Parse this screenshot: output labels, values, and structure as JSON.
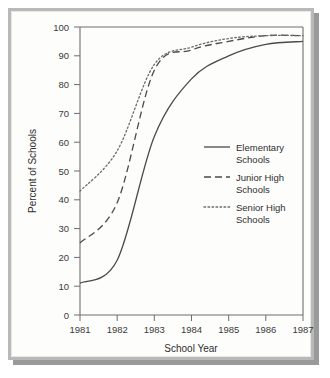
{
  "figure": {
    "frame_color": "#b9b9b7",
    "background_color": "#fdfdfc",
    "line_color": "#4a4a4a"
  },
  "chart_data": {
    "type": "line",
    "title": "",
    "xlabel": "School Year",
    "ylabel": "Percent of Schools",
    "x": [
      1981,
      1982,
      1983,
      1984,
      1985,
      1986,
      1987
    ],
    "categories": [
      "1981",
      "1982",
      "1983",
      "1984",
      "1985",
      "1986",
      "1987"
    ],
    "xlim": [
      1981,
      1987
    ],
    "ylim": [
      0,
      100
    ],
    "yticks": [
      0,
      10,
      20,
      30,
      40,
      50,
      60,
      70,
      80,
      90,
      100
    ],
    "ytick_labels": [
      "0",
      "10",
      "20",
      "30",
      "40",
      "50",
      "60",
      "70",
      "80",
      "90",
      "100"
    ],
    "xticks": [
      1981,
      1982,
      1983,
      1984,
      1985,
      1986,
      1987
    ],
    "xtick_labels": [
      "1981",
      "1982",
      "1983",
      "1984",
      "1985",
      "1986",
      "1987"
    ],
    "grid": false,
    "legend_position": "center-right",
    "series": [
      {
        "name": "Elementary Schools",
        "legend_label_line1": "Elementary",
        "legend_label_line2": "Schools",
        "style": "solid",
        "color": "#4a4a4a",
        "values": [
          11,
          19,
          62,
          82,
          90,
          94,
          95
        ]
      },
      {
        "name": "Junior High Schools",
        "legend_label_line1": "Junior High",
        "legend_label_line2": "Schools",
        "style": "dashed",
        "color": "#4a4a4a",
        "values": [
          25,
          39,
          85,
          92,
          95,
          97,
          97
        ]
      },
      {
        "name": "Senior High Schools",
        "legend_label_line1": "Senior High",
        "legend_label_line2": "Schools",
        "style": "dotted",
        "color": "#6b6b6b",
        "values": [
          43,
          57,
          87,
          93,
          96,
          97,
          97
        ]
      }
    ]
  }
}
